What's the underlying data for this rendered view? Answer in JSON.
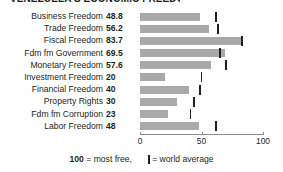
{
  "title_partial": "VENEZUELA'S ECONOMIC FREEDOM SCORES",
  "legend": {
    "scale_bold": "100",
    "scale_text": "= most free,",
    "average_text": "= world average",
    "average_mark": "world-average-tick"
  },
  "axis": {
    "ticks": [
      "0",
      "50",
      "100"
    ],
    "tick_values": [
      0,
      50,
      100
    ],
    "min": 0,
    "max": 100
  },
  "colors": {
    "bar": "#a9a9a9",
    "tick": "#231f20",
    "axis": "#8d8d8d",
    "text": "#231f20",
    "background": "#ffffff"
  },
  "chart_data": {
    "type": "bar",
    "orientation": "horizontal",
    "title": "VENEZUELA'S ECONOMIC FREEDOM SCORES",
    "xlabel": "",
    "ylabel": "",
    "xlim": [
      0,
      100
    ],
    "grid": false,
    "legend_position": "bottom",
    "categories": [
      "Business Freedom",
      "Trade Freedom",
      "Fiscal Freedom",
      "Fdm fm Government",
      "Monetary Freedom",
      "Investment Freedom",
      "Financial Freedom",
      "Property Rights",
      "Fdm fm Corruption",
      "Labor Freedom"
    ],
    "values": [
      48.8,
      56.2,
      83.7,
      69.5,
      57.6,
      20,
      40,
      30,
      23,
      48
    ],
    "value_labels": [
      "48.8",
      "56.2",
      "83.7",
      "69.5",
      "57.6",
      "20",
      "40",
      "30",
      "23",
      "48"
    ],
    "series": [
      {
        "name": "Country score",
        "values": [
          48.8,
          56.2,
          83.7,
          69.5,
          57.6,
          20,
          40,
          30,
          23,
          48
        ]
      },
      {
        "name": "World average",
        "marker": "tick",
        "values": [
          62,
          63.5,
          83,
          65,
          70,
          50,
          49,
          44,
          41,
          62
        ]
      }
    ]
  }
}
